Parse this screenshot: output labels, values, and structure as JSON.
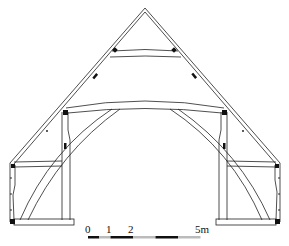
{
  "diagram": {
    "type": "timber roof truss cross-section",
    "colors": {
      "line": "#222222",
      "fill": "#ffffff",
      "joint": "#111111",
      "scale_dark": "#111111",
      "scale_light": "#bbbbbb"
    },
    "scale_bar": {
      "unit": "m",
      "labels": [
        "0",
        "1",
        "2",
        "5m"
      ],
      "segments": 5
    }
  }
}
